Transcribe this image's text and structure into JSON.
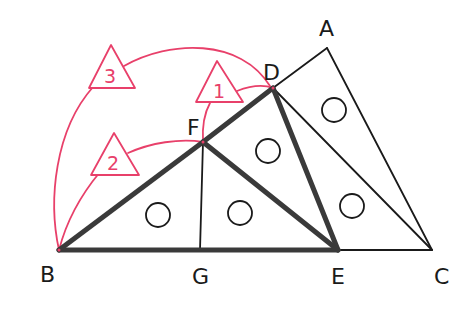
{
  "diagram": {
    "type": "geometry-figure",
    "colors": {
      "line": "#1a1a1a",
      "thick_line": "#3a3a3a",
      "accent_pink": "#e8406a",
      "background": "#ffffff"
    },
    "points": {
      "A": {
        "label": "A",
        "x": 327,
        "y": 48,
        "label_x": 320,
        "label_y": 38
      },
      "B": {
        "label": "B",
        "x": 59,
        "y": 250,
        "label_x": 40,
        "label_y": 282
      },
      "C": {
        "label": "C",
        "x": 432,
        "y": 250,
        "label_x": 436,
        "label_y": 284
      },
      "D": {
        "label": "D",
        "x": 273,
        "y": 88,
        "label_x": 263,
        "label_y": 78
      },
      "E": {
        "label": "E",
        "x": 338,
        "y": 250,
        "label_x": 331,
        "label_y": 284
      },
      "F": {
        "label": "F",
        "x": 203,
        "y": 142,
        "label_x": 188,
        "label_y": 136
      },
      "G": {
        "label": "G",
        "x": 200,
        "y": 250,
        "label_x": 193,
        "label_y": 284
      }
    },
    "thick_segments": [
      "BF",
      "FD",
      "DE",
      "FE",
      "BE"
    ],
    "thin_segments": [
      "DA",
      "AC",
      "DC",
      "EC",
      "FG"
    ],
    "equal_angle_marks": [
      {
        "symbol": "○",
        "region": "triangle BFG"
      },
      {
        "symbol": "○",
        "region": "triangle FGE"
      },
      {
        "symbol": "○",
        "region": "triangle FDE"
      },
      {
        "symbol": "○",
        "region": "triangle DAC"
      },
      {
        "symbol": "○",
        "region": "triangle DEC"
      }
    ],
    "annotations": [
      {
        "id": "tri-1",
        "label": "1",
        "shape": "triangle",
        "arc": "from F to D"
      },
      {
        "id": "tri-2",
        "label": "2",
        "shape": "triangle",
        "arc": "from B to F"
      },
      {
        "id": "tri-3",
        "label": "3",
        "shape": "triangle",
        "arc": "from B to D"
      }
    ]
  }
}
